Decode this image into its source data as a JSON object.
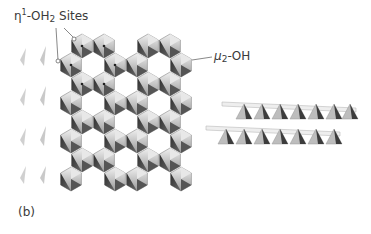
{
  "figure": {
    "panel_label": "(b)",
    "annotations": {
      "eta_sites": {
        "prefix": "η",
        "superscript": "1",
        "mid": "-OH",
        "subscript": "2",
        "suffix": " Sites"
      },
      "mu_oh": {
        "prefix": "μ",
        "subscript": "2",
        "suffix": "-OH"
      }
    },
    "views": [
      {
        "name": "top-view",
        "description": "octahedral sheet, hexagonal ring arrangement"
      },
      {
        "name": "side-view",
        "description": "two stacked layers edge-on"
      }
    ],
    "colors": {
      "dark_face": "#3a3a3a",
      "mid_face": "#8a8a8a",
      "light_face": "#d8d8d8",
      "edge": "#9a9a9a",
      "text": "#3a3a3a"
    }
  }
}
